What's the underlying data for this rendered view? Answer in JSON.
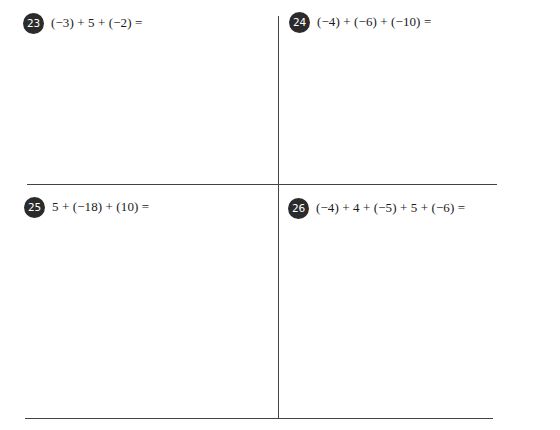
{
  "worksheet": {
    "problems": [
      {
        "number": "23",
        "expression": "(−3) + 5 + (−2) ="
      },
      {
        "number": "24",
        "expression": "(−4) + (−6) + (−10) ="
      },
      {
        "number": "25",
        "expression": "5 + (−18) + (10) ="
      },
      {
        "number": "26",
        "expression": "(−4) + 4 + (−5) + 5 + (−6) ="
      }
    ],
    "colors": {
      "badge_background": "#2b2b2b",
      "badge_text": "#ffffff",
      "rule_lines": "#444444",
      "text": "#1a1a1a",
      "page": "#ffffff"
    }
  }
}
